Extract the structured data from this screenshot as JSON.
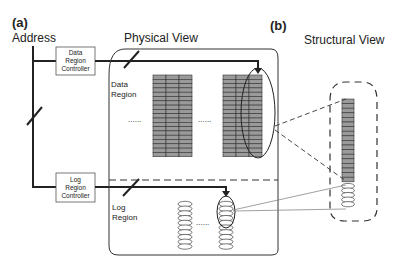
{
  "panel_a": {
    "tag": "(a)",
    "address_label": "Address",
    "physical_view_title": "Physical View",
    "data_region_label": [
      "Data",
      "Region"
    ],
    "log_region_label": [
      "Log",
      "Region"
    ],
    "data_region_controller": [
      "Data",
      "Region",
      "Controller"
    ],
    "log_region_controller": [
      "Log",
      "Region",
      "Controller"
    ],
    "ellipsis": "......"
  },
  "panel_b": {
    "tag": "(b)",
    "structural_view_title": "Structural View"
  },
  "colors": {
    "block_fill": "#9a9a9a",
    "line": "#222222",
    "thin_line": "#777777"
  }
}
